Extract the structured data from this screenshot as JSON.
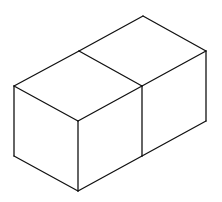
{
  "diagram": {
    "stroke_color": "#111111",
    "background": "#ffffff",
    "vertices": {
      "top_back": [
        143,
        16
      ],
      "top_right": [
        206,
        51
      ],
      "mid_top": [
        79,
        51
      ],
      "left_top": [
        14,
        86
      ],
      "front_top": [
        78,
        121
      ],
      "mid_front": [
        142,
        86
      ],
      "right_bottom": [
        206,
        121
      ],
      "mid_bottom": [
        142,
        156
      ],
      "left_bottom": [
        14,
        156
      ],
      "front_bottom": [
        78,
        191
      ]
    },
    "edges": [
      [
        "top_back",
        "top_right"
      ],
      [
        "top_back",
        "mid_top"
      ],
      [
        "mid_top",
        "left_top"
      ],
      [
        "mid_top",
        "mid_front"
      ],
      [
        "left_top",
        "front_top"
      ],
      [
        "front_top",
        "mid_front"
      ],
      [
        "mid_front",
        "top_right"
      ],
      [
        "top_right",
        "right_bottom"
      ],
      [
        "mid_front",
        "mid_bottom"
      ],
      [
        "right_bottom",
        "mid_bottom"
      ],
      [
        "left_top",
        "left_bottom"
      ],
      [
        "front_top",
        "front_bottom"
      ],
      [
        "left_bottom",
        "front_bottom"
      ],
      [
        "front_bottom",
        "mid_bottom"
      ]
    ]
  }
}
